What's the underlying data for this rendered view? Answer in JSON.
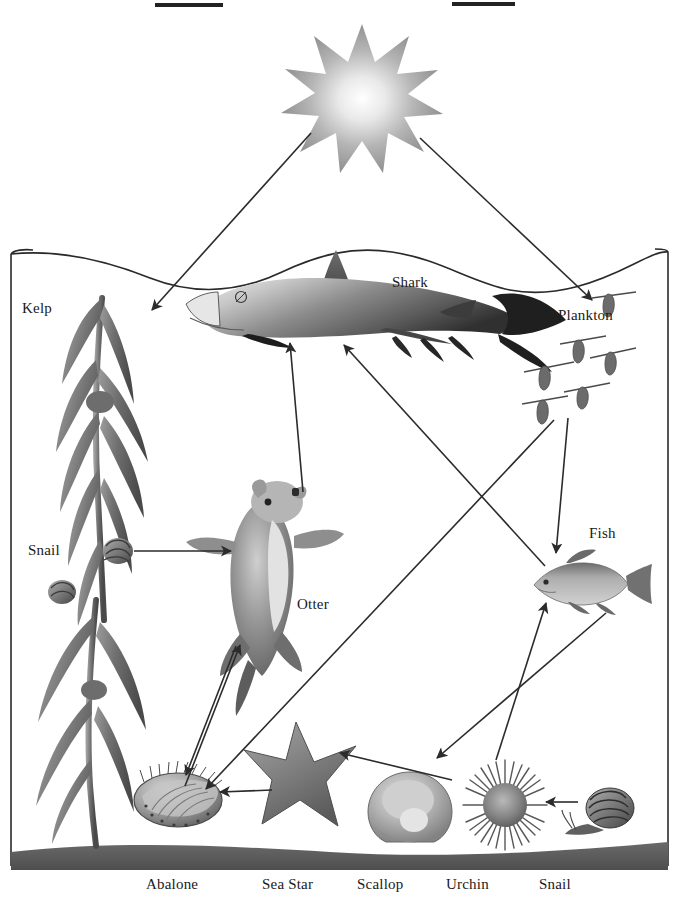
{
  "diagram": {
    "title_redactions": [
      {
        "name": "redaction-bar-left",
        "x": 155,
        "y": 3,
        "w": 68,
        "h": 4
      },
      {
        "name": "redaction-bar-right",
        "x": 452,
        "y": 2,
        "w": 63,
        "h": 4
      }
    ],
    "colors": {
      "ink": "#1a1a1a",
      "frame": "#2a2a2a",
      "seafloor": "#5d5d5d",
      "water": "#ffffff",
      "sun_outer": "#9a9a9a",
      "sun_inner": "#ffffff",
      "kelp_dark": "#5c5c5c",
      "kelp_light": "#a8a8a8",
      "shark_dark": "#4a4a4a",
      "shark_light": "#dcdcdc",
      "otter": "#7b7b7b",
      "arrow": "#2b2b2b"
    },
    "labels": [
      {
        "name": "label-kelp",
        "text": "Kelp",
        "x": 22,
        "y": 300
      },
      {
        "name": "label-snail-left",
        "text": "Snail",
        "x": 28,
        "y": 542
      },
      {
        "name": "label-shark",
        "text": "Shark",
        "x": 392,
        "y": 274
      },
      {
        "name": "label-plankton",
        "text": "Plankton",
        "x": 558,
        "y": 307
      },
      {
        "name": "label-fish",
        "text": "Fish",
        "x": 589,
        "y": 525
      },
      {
        "name": "label-otter",
        "text": "Otter",
        "x": 297,
        "y": 596
      },
      {
        "name": "label-abalone",
        "text": "Abalone",
        "x": 146,
        "y": 876
      },
      {
        "name": "label-sea-star",
        "text": "Sea Star",
        "x": 262,
        "y": 876
      },
      {
        "name": "label-scallop",
        "text": "Scallop",
        "x": 357,
        "y": 876
      },
      {
        "name": "label-urchin",
        "text": "Urchin",
        "x": 446,
        "y": 876
      },
      {
        "name": "label-snail-bottom",
        "text": "Snail",
        "x": 539,
        "y": 876
      }
    ],
    "organisms": [
      {
        "name": "sun",
        "label": "Sun",
        "cx": 362,
        "cy": 86
      },
      {
        "name": "kelp-upper",
        "label": "Kelp",
        "cx": 95,
        "cy": 420
      },
      {
        "name": "kelp-lower",
        "label": "Kelp",
        "cx": 88,
        "cy": 700
      },
      {
        "name": "snail-left",
        "label": "Snail",
        "cx": 118,
        "cy": 552
      },
      {
        "name": "snail-left-2",
        "label": "Snail",
        "cx": 62,
        "cy": 592
      },
      {
        "name": "shark",
        "label": "Shark",
        "cx": 340,
        "cy": 310
      },
      {
        "name": "plankton-group",
        "label": "Plankton",
        "cx": 580,
        "cy": 360
      },
      {
        "name": "fish",
        "label": "Fish",
        "cx": 575,
        "cy": 585
      },
      {
        "name": "otter",
        "label": "Otter",
        "cx": 265,
        "cy": 565
      },
      {
        "name": "abalone",
        "label": "Abalone",
        "cx": 178,
        "cy": 800
      },
      {
        "name": "sea-star",
        "label": "Sea Star",
        "cx": 295,
        "cy": 765
      },
      {
        "name": "scallop",
        "label": "Scallop",
        "cx": 410,
        "cy": 805
      },
      {
        "name": "urchin",
        "label": "Urchin",
        "cx": 505,
        "cy": 805
      },
      {
        "name": "snail-bottom",
        "label": "Snail",
        "cx": 605,
        "cy": 812
      }
    ],
    "arrows": [
      {
        "name": "arrow-sun-to-kelp",
        "from": "Sun",
        "to": "Kelp",
        "x1": 311,
        "y1": 133,
        "x2": 152,
        "y2": 310
      },
      {
        "name": "arrow-sun-to-plankton",
        "from": "Sun",
        "to": "Plankton",
        "x1": 420,
        "y1": 138,
        "x2": 592,
        "y2": 300
      },
      {
        "name": "arrow-snail-to-otter",
        "from": "Snail",
        "to": "Otter",
        "x1": 134,
        "y1": 551,
        "x2": 231,
        "y2": 551
      },
      {
        "name": "arrow-otter-to-shark",
        "from": "Otter",
        "to": "Shark",
        "x1": 303,
        "y1": 492,
        "x2": 290,
        "y2": 343
      },
      {
        "name": "arrow-fish-to-shark",
        "from": "Fish",
        "to": "Shark",
        "x1": 545,
        "y1": 566,
        "x2": 344,
        "y2": 345
      },
      {
        "name": "arrow-plankton-to-fish",
        "from": "Plankton",
        "to": "Fish",
        "x1": 568,
        "y1": 418,
        "x2": 556,
        "y2": 553
      },
      {
        "name": "arrow-urchin-to-fish",
        "from": "Urchin",
        "to": "Fish",
        "x1": 496,
        "y1": 760,
        "x2": 546,
        "y2": 603
      },
      {
        "name": "arrow-plankton-to-abalone",
        "from": "Plankton",
        "to": "Abalone",
        "x1": 554,
        "y1": 420,
        "x2": 206,
        "y2": 789
      },
      {
        "name": "arrow-scallop-to-sea-star",
        "from": "Scallop",
        "to": "Sea Star",
        "x1": 452,
        "y1": 780,
        "x2": 340,
        "y2": 753
      },
      {
        "name": "arrow-sea-star-to-abalone",
        "from": "Sea Star",
        "to": "Abalone",
        "x1": 272,
        "y1": 790,
        "x2": 220,
        "y2": 792
      },
      {
        "name": "arrow-otter-to-abalone",
        "from": "Otter",
        "to": "Abalone",
        "x1": 236,
        "y1": 646,
        "x2": 186,
        "y2": 775
      },
      {
        "name": "arrow-abalone-to-otter",
        "from": "Abalone",
        "to": "Otter",
        "x1": 185,
        "y1": 786,
        "x2": 240,
        "y2": 645
      },
      {
        "name": "arrow-snail-to-urchin",
        "from": "Snail",
        "to": "Urchin",
        "x1": 578,
        "y1": 802,
        "x2": 546,
        "y2": 802
      },
      {
        "name": "arrow-fish-to-scallop",
        "from": "Fish",
        "to": "Scallop",
        "x1": 606,
        "y1": 613,
        "x2": 437,
        "y2": 758
      }
    ],
    "frame": {
      "left": 11,
      "right": 668,
      "top": 248,
      "bottom": 870
    },
    "seafloor": {
      "top": 842,
      "bottom": 870
    }
  }
}
